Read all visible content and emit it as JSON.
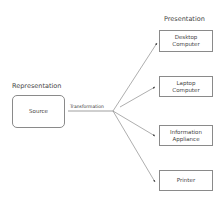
{
  "diagram": {
    "left_heading": "Representation",
    "right_heading": "Presentation",
    "source": {
      "label": "Source"
    },
    "edge_label": "Transformation",
    "targets": [
      {
        "label": "Desktop Computer",
        "line1": "Desktop",
        "line2": "Computer"
      },
      {
        "label": "Laptop Computer",
        "line1": "Laptop",
        "line2": "Computer"
      },
      {
        "label": "Information Appliance",
        "line1": "Information",
        "line2": "Appliance"
      },
      {
        "label": "Printer",
        "line1": "Printer",
        "line2": ""
      }
    ],
    "colors": {
      "line": "#777777",
      "box_border": "#8a8a8a",
      "text": "#444444"
    }
  }
}
